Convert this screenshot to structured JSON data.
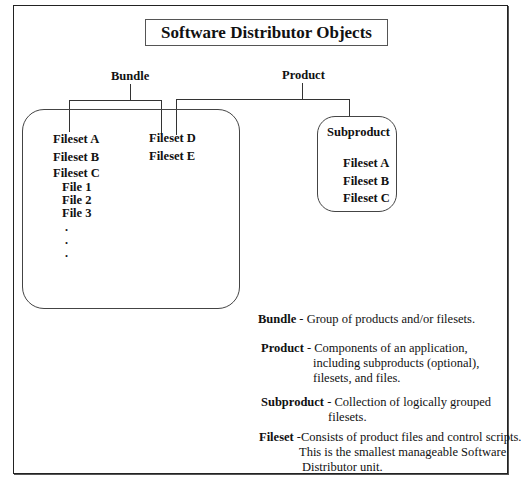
{
  "title": "Software Distributor Objects",
  "diagram": {
    "bundle_label": "Bundle",
    "product_label": "Product",
    "bundle_box": {
      "left_column": [
        "Fileset A",
        "Fileset B",
        "Fileset C"
      ],
      "files": [
        "File 1",
        "File 2",
        "File 3"
      ],
      "ellipsis": [
        ".",
        ".",
        "."
      ],
      "right_column": [
        "Fileset D",
        "Fileset E"
      ]
    },
    "subproduct_box": {
      "title": "Subproduct",
      "items": [
        "Fileset A",
        "Fileset B",
        "Fileset C"
      ]
    }
  },
  "definitions": [
    {
      "term": "Bundle",
      "sep": " - ",
      "lines": [
        "Group of products and/or filesets."
      ]
    },
    {
      "term": "Product",
      "sep": " - ",
      "lines": [
        "Components of an application,",
        "including subproducts (optional),",
        "filesets, and files."
      ]
    },
    {
      "term": "Subproduct",
      "sep": " - ",
      "lines": [
        "Collection of logically grouped",
        "filesets."
      ]
    },
    {
      "term": "Fileset",
      "sep": " -",
      "lines": [
        "Consists of product files and control scripts.",
        "This is the smallest manageable Software",
        "Distributor unit."
      ]
    }
  ]
}
